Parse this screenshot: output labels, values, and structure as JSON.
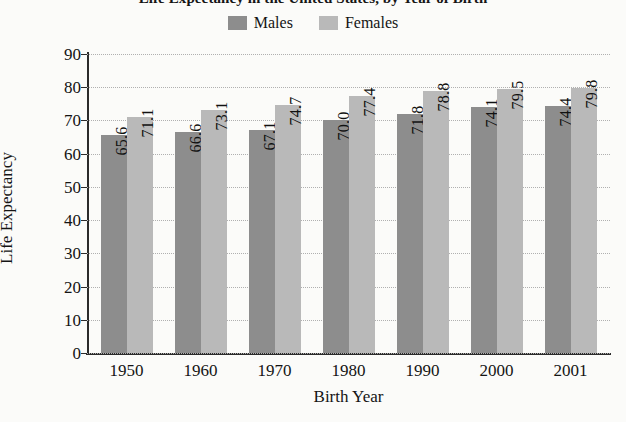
{
  "chart_data": {
    "type": "bar",
    "title": "Life Expectancy in the United States, by Year of Birth",
    "xlabel": "Birth Year",
    "ylabel": "Life Expectancy",
    "categories": [
      "1950",
      "1960",
      "1970",
      "1980",
      "1990",
      "2000",
      "2001"
    ],
    "series": [
      {
        "name": "Males",
        "color": "#8d8d8d",
        "values": [
          65.6,
          66.6,
          67.1,
          70.0,
          71.8,
          74.1,
          74.4
        ],
        "labels": [
          "65.6",
          "66.6",
          "67.1",
          "70.0",
          "71.8",
          "74.1",
          "74.4"
        ]
      },
      {
        "name": "Females",
        "color": "#b9b9b9",
        "values": [
          71.1,
          73.1,
          74.7,
          77.4,
          78.8,
          79.5,
          79.8
        ],
        "labels": [
          "71.1",
          "73.1",
          "74.7",
          "77.4",
          "78.8",
          "79.5",
          "79.8"
        ]
      }
    ],
    "ylim": [
      0,
      90
    ],
    "yticks": [
      0,
      10,
      20,
      30,
      40,
      50,
      60,
      70,
      80,
      90
    ],
    "ytick_labels": [
      "0",
      "10",
      "20",
      "30",
      "40",
      "50",
      "60",
      "70",
      "80",
      "90"
    ],
    "grid": true,
    "legend_position": "top-center",
    "bar_value_labels": true,
    "bar_value_label_rotation": -90,
    "background_color": "#fbfbf9",
    "axis_color": "#2b2b2b",
    "gridline_color": "#b0b0b0"
  },
  "legend": {
    "items": [
      {
        "label": "Males",
        "color": "#8d8d8d"
      },
      {
        "label": "Females",
        "color": "#b9b9b9"
      }
    ]
  }
}
